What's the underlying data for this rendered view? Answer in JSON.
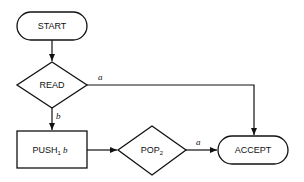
{
  "diagram": {
    "type": "flowchart",
    "nodes": {
      "start": {
        "label": "START",
        "shape": "rounded-rect"
      },
      "read": {
        "label": "READ",
        "shape": "diamond"
      },
      "push": {
        "label": "PUSH",
        "sub": "1",
        "arg": " b",
        "shape": "rect"
      },
      "pop": {
        "label": "POP",
        "sub": "2",
        "shape": "diamond"
      },
      "accept": {
        "label": "ACCEPT",
        "shape": "rounded-rect"
      }
    },
    "edges": [
      {
        "from": "start",
        "to": "read",
        "label": ""
      },
      {
        "from": "read",
        "to": "accept",
        "label": "a"
      },
      {
        "from": "read",
        "to": "push",
        "label": "b"
      },
      {
        "from": "push",
        "to": "pop",
        "label": ""
      },
      {
        "from": "pop",
        "to": "accept",
        "label": "a"
      }
    ],
    "colors": {
      "stroke": "#111111",
      "background": "#ffffff"
    }
  }
}
